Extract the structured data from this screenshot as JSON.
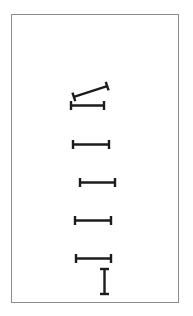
{
  "figure": {
    "title": "",
    "background_color": "#ffffff",
    "frame": {
      "x": 11,
      "y": 14,
      "width": 168,
      "height": 289,
      "border_color": "#8d8d8d",
      "border_width": 1,
      "fill_color": "#ffffff"
    }
  },
  "chart_data": {
    "type": "scatter",
    "title": "",
    "xlabel": "",
    "ylabel": "",
    "grid": false,
    "legend": null,
    "marker_style": "i-beam-dumbbell",
    "marker_color": "#1c1c1c",
    "xlim": [
      0,
      168
    ],
    "ylim": [
      0,
      289
    ],
    "series": [
      {
        "name": "i-beam markers",
        "points": [
          {
            "id": "marker-1",
            "x": 61,
            "y": 72,
            "length": 35,
            "angle": -18,
            "cap_height": 9,
            "bar_width": 2.4
          },
          {
            "id": "marker-2",
            "x": 59,
            "y": 86,
            "length": 33,
            "angle": 0,
            "cap_height": 9,
            "bar_width": 2.4
          },
          {
            "id": "marker-3",
            "x": 61,
            "y": 125,
            "length": 36,
            "angle": 0,
            "cap_height": 9,
            "bar_width": 2.4
          },
          {
            "id": "marker-4",
            "x": 68,
            "y": 163,
            "length": 35,
            "angle": 0,
            "cap_height": 9,
            "bar_width": 2.4
          },
          {
            "id": "marker-5",
            "x": 63,
            "y": 201,
            "length": 36,
            "angle": 0,
            "cap_height": 9,
            "bar_width": 2.4
          },
          {
            "id": "marker-6",
            "x": 64,
            "y": 239,
            "length": 35,
            "angle": 0,
            "cap_height": 9,
            "bar_width": 2.4
          },
          {
            "id": "marker-7",
            "x": 80,
            "y": 262,
            "length": 25,
            "angle": 90,
            "cap_height": 9,
            "bar_width": 2.4
          }
        ]
      }
    ],
    "counts": {
      "horizontal_markers": 5,
      "tilted_markers": 1,
      "vertical_markers": 1,
      "total_markers": 7
    }
  }
}
